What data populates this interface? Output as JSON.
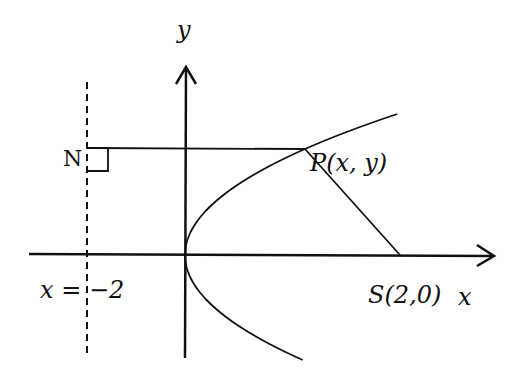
{
  "diagram": {
    "labels": {
      "y_axis": "y",
      "x_axis": "x",
      "point_N": "N",
      "point_P": "P(x, y)",
      "focus_S": "S(2,0)",
      "directrix": "x = −2"
    },
    "math": {
      "focus": [
        2,
        0
      ],
      "directrix_x": -2,
      "curve": "y^2 = 8x"
    },
    "colors": {
      "stroke": "#111111",
      "background": "#ffffff"
    }
  }
}
